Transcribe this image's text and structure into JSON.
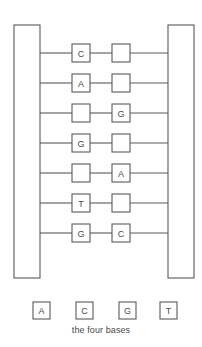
{
  "diagram": {
    "caption": "the four bases",
    "stroke_color": "#5a5a5a",
    "fill_color": "#ffffff",
    "text_color": "#4a4a4a",
    "backbones": [
      {
        "side": "left",
        "x": 14,
        "y": 25,
        "width": 26,
        "height": 253
      },
      {
        "side": "right",
        "x": 168,
        "y": 25,
        "width": 26,
        "height": 253
      }
    ],
    "rungs": [
      {
        "index": 1,
        "y": 53,
        "left_base": "C",
        "right_base": ""
      },
      {
        "index": 2,
        "y": 83,
        "left_base": "A",
        "right_base": ""
      },
      {
        "index": 3,
        "y": 113,
        "left_base": "",
        "right_base": "G"
      },
      {
        "index": 4,
        "y": 143,
        "left_base": "G",
        "right_base": ""
      },
      {
        "index": 5,
        "y": 173,
        "left_base": "",
        "right_base": "A"
      },
      {
        "index": 6,
        "y": 203,
        "left_base": "T",
        "right_base": ""
      },
      {
        "index": 7,
        "y": 233,
        "left_base": "G",
        "right_base": "C"
      }
    ],
    "box_size": 18,
    "left_box_x": 72,
    "right_box_x": 112,
    "legend": {
      "box_size": 17,
      "box_y": 302,
      "items": [
        {
          "label": "A",
          "x": 33
        },
        {
          "label": "C",
          "x": 76
        },
        {
          "label": "G",
          "x": 119
        },
        {
          "label": "T",
          "x": 160
        }
      ]
    }
  }
}
